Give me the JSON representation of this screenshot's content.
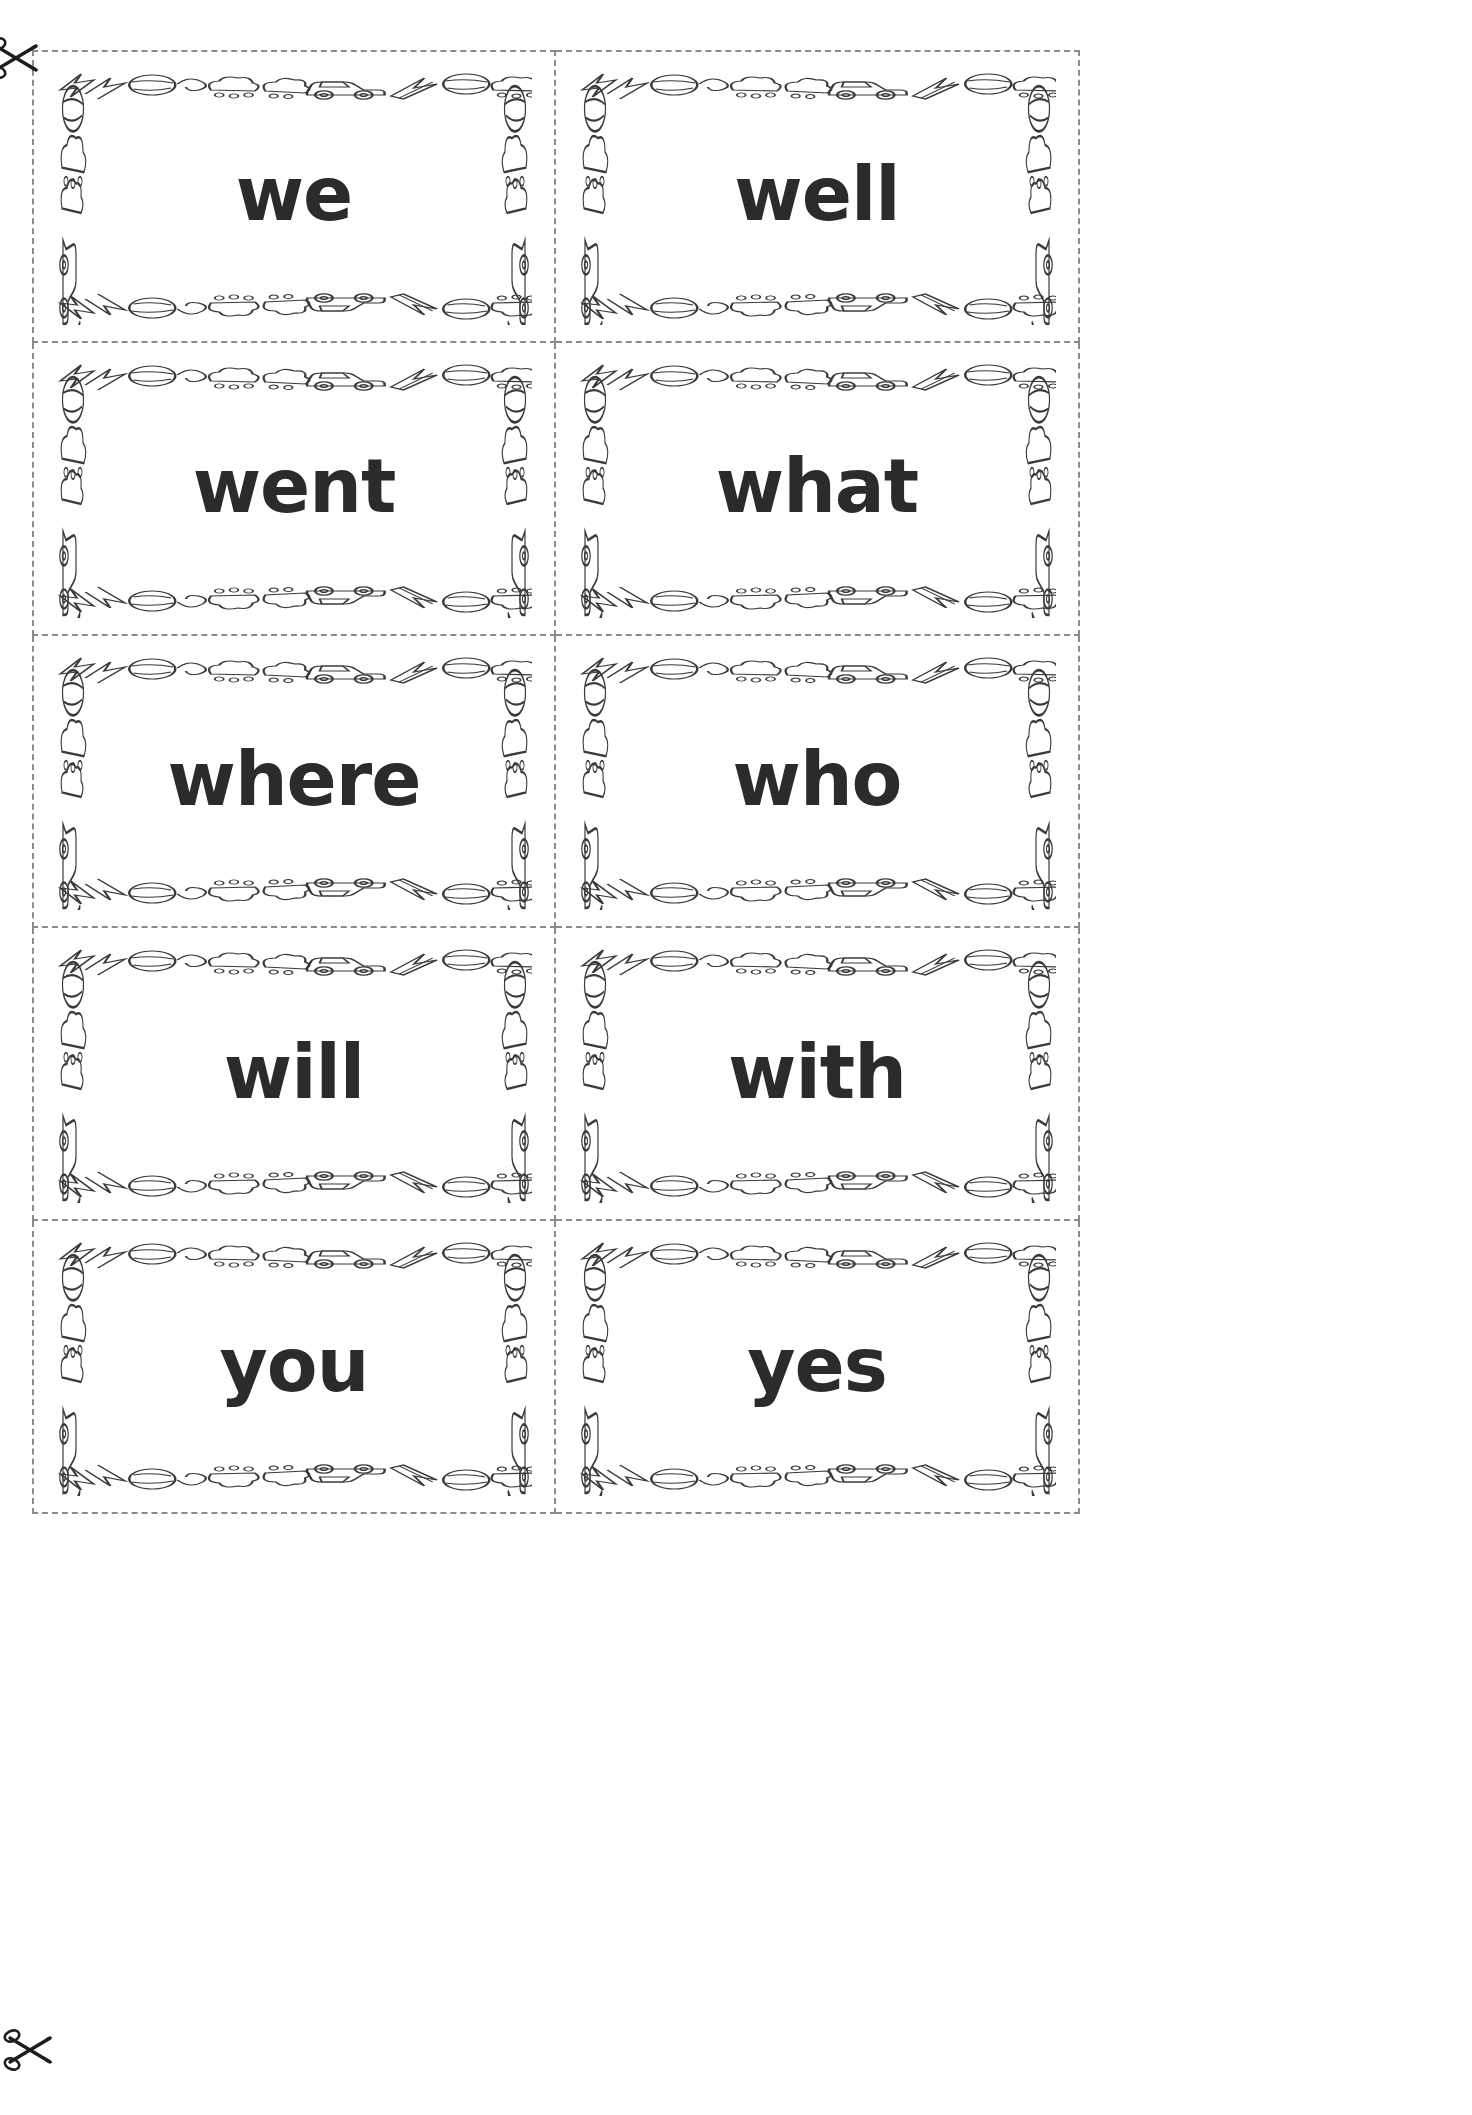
{
  "page": {
    "background_color": "#ffffff",
    "ink_color": "#2b2b2b",
    "cut_line_color": "#8b8b8b",
    "border_theme": "toys-and-cars"
  },
  "cut_marks": [
    {
      "name": "scissors-top",
      "icon": "scissors-icon",
      "position": "top-left-margin"
    },
    {
      "name": "scissors-bottom",
      "icon": "scissors-icon",
      "position": "bottom-left-margin"
    }
  ],
  "grid": {
    "columns": 2,
    "rows": 5,
    "total_cards": 10
  },
  "cards": [
    {
      "word": "we",
      "row": 1,
      "column": 1
    },
    {
      "word": "well",
      "row": 1,
      "column": 2
    },
    {
      "word": "went",
      "row": 2,
      "column": 1
    },
    {
      "word": "what",
      "row": 2,
      "column": 2
    },
    {
      "word": "where",
      "row": 3,
      "column": 1
    },
    {
      "word": "who",
      "row": 3,
      "column": 2
    },
    {
      "word": "will",
      "row": 4,
      "column": 1
    },
    {
      "word": "with",
      "row": 4,
      "column": 2
    },
    {
      "word": "you",
      "row": 5,
      "column": 1
    },
    {
      "word": "yes",
      "row": 5,
      "column": 2
    }
  ],
  "border_motifs": [
    "lightning-bolt-icon",
    "beach-ball-icon",
    "swirl-icon",
    "bush-icon",
    "car-icon",
    "bush-icon",
    "starburst-icon",
    "arrow-icon",
    "beach-ball-icon",
    "wave-icon"
  ]
}
